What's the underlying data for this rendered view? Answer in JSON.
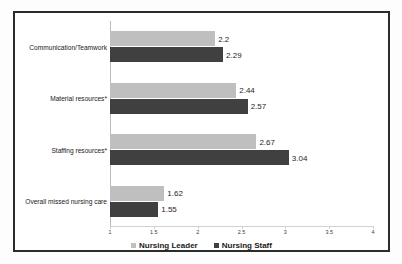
{
  "chart_data": {
    "type": "bar",
    "orientation": "horizontal",
    "title": "",
    "subtitle": "",
    "xlabel": "",
    "ylabel": "",
    "xlim": [
      1,
      4
    ],
    "xticks": [
      "1",
      "1.5",
      "2",
      "2.5",
      "3",
      "3.5",
      "4"
    ],
    "xtick_values": [
      1,
      1.5,
      2,
      2.5,
      3,
      3.5,
      4
    ],
    "grid": false,
    "legend_position": "bottom-center",
    "categories": [
      "Communication/Teamwork",
      "Material resources*",
      "Staffing resources*",
      "Overall missed nursing care"
    ],
    "series": [
      {
        "name": "Nursing Leader",
        "color": "#bfbfbf",
        "values": [
          2.2,
          2.44,
          2.67,
          1.62
        ],
        "labels": [
          "2.2",
          "2.44",
          "2.67",
          "1.62"
        ]
      },
      {
        "name": "Nursing Staff",
        "color": "#404040",
        "values": [
          2.29,
          2.57,
          3.04,
          1.55
        ],
        "labels": [
          "2.29",
          "2.57",
          "3.04",
          "1.55"
        ]
      }
    ]
  },
  "legend": {
    "items": [
      {
        "label": "Nursing Leader",
        "color": "#bfbfbf"
      },
      {
        "label": "Nursing Staff",
        "color": "#404040"
      }
    ]
  },
  "colors": {
    "leader": "#bfbfbf",
    "staff": "#404040",
    "frame": "#2b2b2b",
    "axis": "#cfcfcf",
    "text": "#1a1a1a",
    "background": "#ffffff"
  }
}
